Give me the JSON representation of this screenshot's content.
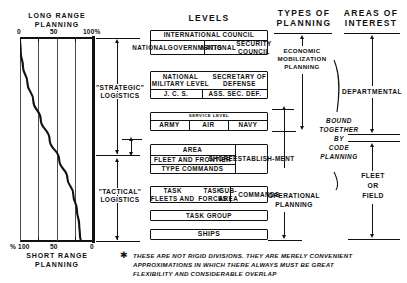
{
  "figure": {
    "title_columns": {
      "levels": "LEVELS",
      "types_of_planning": "TYPES OF\nPLANNING",
      "areas_of_interest": "AREAS OF\nINTEREST"
    },
    "footnote": {
      "marker": "✱",
      "line1": "THESE ARE NOT RIGID DIVISIONS.  THEY ARE MERELY CONVENIENT",
      "line2": "APPROXIMATIONS IN WHICH THERE ALWAYS MUST BE GREAT",
      "line3": "FLEXIBILITY AND CONSIDERABLE OVERLAP"
    }
  },
  "chart_data": {
    "type": "line",
    "top_axis_label": "LONG RANGE\nPLANNING",
    "bottom_axis_label": "SHORT RANGE\nPLANNING",
    "top_ticks": [
      "0",
      "50",
      "100%"
    ],
    "top_tick_values": [
      0,
      50,
      100
    ],
    "bottom_ticks": [
      "% 100",
      "50",
      "0"
    ],
    "bottom_tick_values": [
      100,
      50,
      0
    ],
    "xlim": [
      0,
      100
    ],
    "ylabel": "",
    "xlabel": "PERCENT OF PLANNING EFFORT",
    "grid": true,
    "gridlines_at": [
      0,
      25,
      50,
      75,
      100
    ],
    "series": [
      {
        "name": "long range planning share by organizational level",
        "x": [
          100,
          99,
          96,
          90,
          82,
          72,
          60,
          47,
          36,
          28,
          23,
          20,
          19,
          18
        ],
        "y_level": [
          0,
          7,
          14,
          22,
          31,
          40,
          50,
          60,
          69,
          77,
          85,
          92,
          97,
          100
        ]
      }
    ],
    "annotations": [
      {
        "text": "\"STRATEGIC\"\nLOGISTICS",
        "span_from_pct": 0,
        "span_to_pct": 60
      },
      {
        "text": "\"TACTICAL\"\nLOGISTICS",
        "span_from_pct": 60,
        "span_to_pct": 100
      }
    ]
  },
  "levels": {
    "heading": "LEVELS",
    "groups": [
      {
        "id": "international",
        "rows": [
          {
            "cells": [
              {
                "text": "INTERNATIONAL  COUNCIL",
                "w": 100
              }
            ]
          },
          {
            "cells": [
              {
                "text": "NATIONAL\nGOVERNMENTS",
                "w": 46
              },
              {
                "text": "NATIONAL\nSECURITY COUNCIL",
                "w": 54
              }
            ]
          }
        ]
      },
      {
        "id": "national-military",
        "rows": [
          {
            "cells": [
              {
                "text": "NATIONAL  MILITARY  LEVEL\nSECRETARY  OF  DEFENSE",
                "w": 100
              }
            ]
          },
          {
            "cells": [
              {
                "text": "J. C. S.",
                "w": 44
              },
              {
                "text": "ASS. SEC. DEF.",
                "w": 56
              }
            ]
          }
        ]
      },
      {
        "id": "service",
        "rows": [
          {
            "cells": [
              {
                "text": "SERVICE  LEVEL",
                "w": 100
              }
            ]
          },
          {
            "cells": [
              {
                "text": "ARMY",
                "w": 33
              },
              {
                "text": "AIR",
                "w": 33
              },
              {
                "text": "NAVY",
                "w": 34
              }
            ]
          }
        ]
      },
      {
        "id": "area",
        "rows": [
          {
            "cells": [
              {
                "text": "AREA",
                "w": 72
              },
              {
                "text": "SHORE\nESTABLISH-\nMENT",
                "w": 28
              }
            ]
          },
          {
            "cells": [
              {
                "text": "FLEET AND FRONTIER",
                "w": 72
              }
            ]
          },
          {
            "cells": [
              {
                "text": "TYPE COMMANDS",
                "w": 72
              }
            ]
          }
        ]
      },
      {
        "id": "task-fleets",
        "rows": [
          {
            "cells": [
              {
                "text": "TASK FLEETS AND\nTASK FORCES",
                "w": 68
              },
              {
                "text": "SUB-AREA\nCOMMANDS",
                "w": 32
              }
            ]
          }
        ]
      },
      {
        "id": "task-group",
        "rows": [
          {
            "cells": [
              {
                "text": "TASK  GROUP",
                "w": 100
              }
            ]
          }
        ]
      },
      {
        "id": "ships",
        "rows": [
          {
            "cells": [
              {
                "text": "SHIPS",
                "w": 100
              }
            ]
          }
        ]
      }
    ]
  },
  "types_of_planning": {
    "heading": "TYPES OF\nPLANNING",
    "items": [
      {
        "id": "economic-mobilization",
        "text": "ECONOMIC\nMOBILIZATION\nPLANNING"
      },
      {
        "id": "bound-together",
        "text": "BOUND\nTOGETHER\nBY\nCODE\nPLANNING",
        "italic": true
      },
      {
        "id": "operational",
        "text": "OPERATIONAL\nPLANNING"
      }
    ]
  },
  "areas_of_interest": {
    "heading": "AREAS OF\nINTEREST",
    "items": [
      {
        "id": "departmental",
        "text": "DEPARTMENTAL"
      },
      {
        "id": "fleet-or-field",
        "text": "FLEET\nOR\nFIELD"
      }
    ]
  },
  "chart_labels": {
    "long_range_l1": "LONG RANGE",
    "long_range_l2": "PLANNING",
    "short_range_l1": "SHORT RANGE",
    "short_range_l2": "PLANNING",
    "tick_0": "0",
    "tick_50": "50",
    "tick_100": "100%",
    "btick_100": "% 100",
    "btick_50": "50",
    "btick_0": "0",
    "strategic_l1": "\"STRATEGIC\"",
    "strategic_l2": "LOGISTICS",
    "tactical_l1": "\"TACTICAL\"",
    "tactical_l2": "LOGISTICS"
  },
  "colors": {
    "ink": "#111111",
    "grid": "#4a4a4a",
    "paper": "#ffffff"
  }
}
